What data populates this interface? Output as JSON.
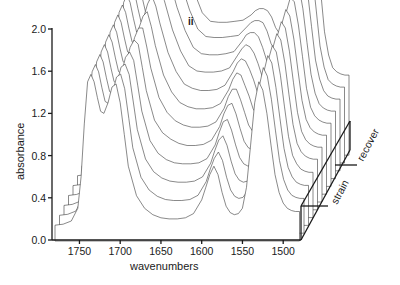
{
  "chart_data": {
    "type": "line",
    "subtype": "3d-waterfall",
    "title": "",
    "panel_label": "ii",
    "xlabel": "wavenumbers",
    "ylabel": "absorbance",
    "xlim": [
      1780,
      1480
    ],
    "ylim": [
      0.0,
      2.0
    ],
    "x_ticks": [
      1750,
      1700,
      1650,
      1600,
      1550,
      1500
    ],
    "y_ticks": [
      "0.0",
      "0.4",
      "0.8",
      "1.2",
      "1.6",
      "2.0"
    ],
    "depth_axis_labels": [
      "strain",
      "recover"
    ],
    "grid": false,
    "legend": null,
    "trace_count": 12,
    "x": [
      1780,
      1770,
      1760,
      1752,
      1748,
      1744,
      1740,
      1736,
      1732,
      1728,
      1724,
      1720,
      1715,
      1710,
      1705,
      1700,
      1695,
      1690,
      1680,
      1670,
      1660,
      1650,
      1640,
      1630,
      1620,
      1610,
      1600,
      1595,
      1590,
      1585,
      1580,
      1575,
      1570,
      1565,
      1560,
      1555,
      1550,
      1545,
      1540,
      1535,
      1530,
      1525,
      1520,
      1515,
      1510,
      1505,
      1500,
      1495,
      1490,
      1485,
      1480
    ],
    "series": [
      {
        "name": "trace 1 (strain start)",
        "values": [
          0.14,
          0.15,
          0.18,
          0.3,
          0.6,
          1.1,
          1.5,
          1.57,
          1.5,
          1.35,
          1.22,
          1.2,
          1.3,
          1.45,
          1.48,
          1.3,
          1.0,
          0.7,
          0.42,
          0.3,
          0.24,
          0.21,
          0.2,
          0.2,
          0.21,
          0.25,
          0.38,
          0.5,
          0.62,
          0.7,
          0.62,
          0.45,
          0.32,
          0.26,
          0.24,
          0.25,
          0.3,
          0.5,
          0.9,
          1.3,
          1.5,
          1.42,
          1.2,
          0.9,
          0.62,
          0.45,
          0.35,
          0.3,
          0.28,
          0.27,
          0.27
        ]
      },
      {
        "name": "trace 2",
        "values": [
          0.16,
          0.17,
          0.2,
          0.32,
          0.62,
          1.12,
          1.52,
          1.59,
          1.52,
          1.37,
          1.24,
          1.22,
          1.32,
          1.47,
          1.5,
          1.36,
          1.08,
          0.8,
          0.52,
          0.4,
          0.34,
          0.31,
          0.3,
          0.3,
          0.31,
          0.35,
          0.48,
          0.6,
          0.7,
          0.76,
          0.68,
          0.52,
          0.4,
          0.34,
          0.32,
          0.33,
          0.38,
          0.58,
          0.98,
          1.38,
          1.56,
          1.48,
          1.26,
          0.96,
          0.68,
          0.5,
          0.4,
          0.35,
          0.33,
          0.32,
          0.32
        ]
      },
      {
        "name": "trace 3",
        "values": [
          0.18,
          0.19,
          0.22,
          0.34,
          0.64,
          1.14,
          1.54,
          1.61,
          1.54,
          1.39,
          1.26,
          1.24,
          1.34,
          1.49,
          1.52,
          1.42,
          1.16,
          0.9,
          0.62,
          0.5,
          0.44,
          0.41,
          0.4,
          0.4,
          0.41,
          0.45,
          0.58,
          0.7,
          0.8,
          0.84,
          0.75,
          0.6,
          0.48,
          0.42,
          0.4,
          0.41,
          0.46,
          0.66,
          1.06,
          1.44,
          1.6,
          1.53,
          1.3,
          1.0,
          0.72,
          0.54,
          0.45,
          0.4,
          0.38,
          0.37,
          0.37
        ]
      },
      {
        "name": "trace 4",
        "values": [
          0.2,
          0.21,
          0.24,
          0.36,
          0.66,
          1.16,
          1.56,
          1.63,
          1.56,
          1.41,
          1.28,
          1.26,
          1.36,
          1.51,
          1.56,
          1.48,
          1.24,
          1.0,
          0.72,
          0.6,
          0.54,
          0.51,
          0.5,
          0.5,
          0.51,
          0.55,
          0.68,
          0.8,
          0.9,
          0.92,
          0.82,
          0.68,
          0.56,
          0.5,
          0.48,
          0.49,
          0.54,
          0.74,
          1.12,
          1.48,
          1.62,
          1.56,
          1.34,
          1.04,
          0.76,
          0.58,
          0.5,
          0.45,
          0.43,
          0.42,
          0.42
        ]
      },
      {
        "name": "trace 5",
        "values": [
          0.22,
          0.23,
          0.26,
          0.38,
          0.68,
          1.18,
          1.58,
          1.65,
          1.58,
          1.43,
          1.3,
          1.28,
          1.38,
          1.53,
          1.6,
          1.56,
          1.34,
          1.12,
          0.84,
          0.72,
          0.66,
          0.62,
          0.6,
          0.6,
          0.61,
          0.65,
          0.78,
          0.9,
          0.98,
          1.0,
          0.9,
          0.76,
          0.64,
          0.58,
          0.56,
          0.57,
          0.62,
          0.82,
          1.18,
          1.52,
          1.66,
          1.6,
          1.38,
          1.08,
          0.8,
          0.62,
          0.54,
          0.5,
          0.48,
          0.47,
          0.47
        ]
      },
      {
        "name": "trace 6",
        "values": [
          0.24,
          0.25,
          0.28,
          0.4,
          0.7,
          1.2,
          1.6,
          1.67,
          1.6,
          1.45,
          1.32,
          1.3,
          1.4,
          1.55,
          1.64,
          1.64,
          1.46,
          1.26,
          0.98,
          0.84,
          0.76,
          0.72,
          0.7,
          0.7,
          0.71,
          0.75,
          0.88,
          0.99,
          1.06,
          1.06,
          0.96,
          0.84,
          0.72,
          0.66,
          0.64,
          0.65,
          0.7,
          0.9,
          1.24,
          1.56,
          1.7,
          1.64,
          1.42,
          1.12,
          0.84,
          0.66,
          0.58,
          0.54,
          0.52,
          0.51,
          0.51
        ]
      },
      {
        "name": "trace 7",
        "values": [
          0.26,
          0.27,
          0.3,
          0.42,
          0.72,
          1.22,
          1.62,
          1.69,
          1.62,
          1.47,
          1.34,
          1.32,
          1.42,
          1.57,
          1.68,
          1.72,
          1.58,
          1.4,
          1.12,
          0.96,
          0.86,
          0.82,
          0.8,
          0.8,
          0.81,
          0.85,
          0.98,
          1.08,
          1.14,
          1.12,
          1.02,
          0.92,
          0.8,
          0.74,
          0.72,
          0.73,
          0.78,
          0.98,
          1.3,
          1.6,
          1.74,
          1.68,
          1.46,
          1.16,
          0.88,
          0.7,
          0.62,
          0.58,
          0.56,
          0.55,
          0.55
        ]
      },
      {
        "name": "trace 8",
        "values": [
          0.28,
          0.29,
          0.32,
          0.44,
          0.74,
          1.24,
          1.64,
          1.71,
          1.64,
          1.49,
          1.36,
          1.34,
          1.44,
          1.59,
          1.72,
          1.8,
          1.7,
          1.54,
          1.26,
          1.08,
          0.96,
          0.92,
          0.9,
          0.9,
          0.91,
          0.95,
          1.08,
          1.16,
          1.2,
          1.18,
          1.1,
          1.0,
          0.88,
          0.82,
          0.8,
          0.81,
          0.86,
          1.06,
          1.36,
          1.64,
          1.78,
          1.74,
          1.52,
          1.22,
          0.92,
          0.74,
          0.66,
          0.62,
          0.6,
          0.59,
          0.59
        ]
      },
      {
        "name": "trace 9",
        "values": [
          0.3,
          0.31,
          0.34,
          0.46,
          0.76,
          1.26,
          1.66,
          1.73,
          1.66,
          1.51,
          1.38,
          1.36,
          1.46,
          1.61,
          1.76,
          1.88,
          1.82,
          1.68,
          1.4,
          1.2,
          1.06,
          1.01,
          1.0,
          1.0,
          1.01,
          1.04,
          1.16,
          1.22,
          1.26,
          1.24,
          1.18,
          1.08,
          0.96,
          0.9,
          0.88,
          0.89,
          0.94,
          1.14,
          1.42,
          1.7,
          1.84,
          1.82,
          1.6,
          1.28,
          0.98,
          0.8,
          0.7,
          0.66,
          0.64,
          0.63,
          0.63
        ]
      },
      {
        "name": "trace 10",
        "values": [
          0.32,
          0.33,
          0.36,
          0.48,
          0.78,
          1.28,
          1.68,
          1.75,
          1.68,
          1.53,
          1.4,
          1.38,
          1.48,
          1.63,
          1.8,
          1.96,
          1.94,
          1.82,
          1.54,
          1.32,
          1.16,
          1.1,
          1.09,
          1.09,
          1.1,
          1.12,
          1.22,
          1.28,
          1.3,
          1.3,
          1.26,
          1.16,
          1.04,
          0.98,
          0.96,
          0.97,
          1.02,
          1.22,
          1.5,
          1.78,
          1.92,
          1.92,
          1.7,
          1.36,
          1.04,
          0.86,
          0.75,
          0.7,
          0.68,
          0.67,
          0.67
        ]
      },
      {
        "name": "trace 11",
        "values": [
          0.34,
          0.35,
          0.38,
          0.5,
          0.8,
          1.3,
          1.7,
          1.77,
          1.7,
          1.55,
          1.42,
          1.4,
          1.5,
          1.65,
          1.84,
          2.04,
          2.06,
          1.96,
          1.68,
          1.44,
          1.26,
          1.19,
          1.18,
          1.18,
          1.19,
          1.2,
          1.28,
          1.32,
          1.34,
          1.34,
          1.32,
          1.24,
          1.12,
          1.06,
          1.04,
          1.05,
          1.1,
          1.3,
          1.58,
          1.86,
          2.02,
          2.04,
          1.82,
          1.46,
          1.1,
          0.9,
          0.78,
          0.74,
          0.72,
          0.71,
          0.71
        ]
      },
      {
        "name": "trace 12 (recover end)",
        "values": [
          0.36,
          0.37,
          0.4,
          0.52,
          0.82,
          1.32,
          1.72,
          1.79,
          1.72,
          1.57,
          1.44,
          1.42,
          1.52,
          1.67,
          1.88,
          2.1,
          2.16,
          2.08,
          1.8,
          1.54,
          1.34,
          1.26,
          1.25,
          1.25,
          1.26,
          1.27,
          1.32,
          1.36,
          1.38,
          1.38,
          1.36,
          1.3,
          1.2,
          1.14,
          1.12,
          1.13,
          1.18,
          1.38,
          1.66,
          1.94,
          2.12,
          2.16,
          1.94,
          1.56,
          1.16,
          0.94,
          0.82,
          0.78,
          0.76,
          0.75,
          0.75
        ]
      }
    ]
  },
  "layout": {
    "plot_origin_px": [
      52,
      240
    ],
    "x_px_per_unit": 0.815,
    "y_px_per_unit": 105.5,
    "depth_step_px": [
      4.5,
      -7.8
    ],
    "line_color": "#3a3a3a",
    "axis_color": "#1a1a1a"
  }
}
